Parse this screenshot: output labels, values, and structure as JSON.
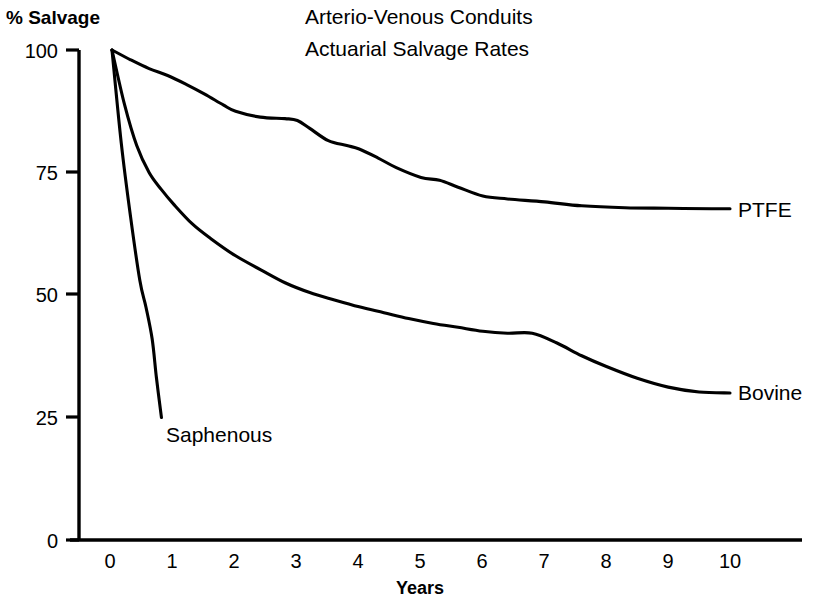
{
  "chart_data": {
    "type": "line",
    "title": "Arterio-Venous Conduits",
    "subtitle": "Actuarial Salvage Rates",
    "xlabel": "Years",
    "ylabel": "% Salvage",
    "xlim": [
      0,
      10
    ],
    "ylim": [
      0,
      100
    ],
    "grid": false,
    "legend_position": "inline-right-end-of-curve",
    "x_ticks": [
      "0",
      "1",
      "2",
      "3",
      "4",
      "5",
      "6",
      "7",
      "8",
      "9",
      "10"
    ],
    "y_ticks": [
      "0",
      "25",
      "50",
      "75",
      "100"
    ],
    "series": [
      {
        "name": "PTFE",
        "label": "PTFE",
        "x": [
          0,
          0.3,
          0.6,
          0.9,
          1.2,
          1.5,
          1.8,
          2.0,
          2.4,
          2.8,
          3.0,
          3.2,
          3.5,
          3.8,
          4.0,
          4.3,
          4.6,
          5.0,
          5.3,
          5.6,
          6.0,
          6.4,
          7.0,
          7.6,
          8.3,
          9.0,
          9.7,
          10.0
        ],
        "values": [
          100,
          98.0,
          96.2,
          94.8,
          93.0,
          91.0,
          88.8,
          87.5,
          86.3,
          86.0,
          85.6,
          84.0,
          81.5,
          80.5,
          79.8,
          78.0,
          76.0,
          74.0,
          73.4,
          72.0,
          70.2,
          69.6,
          69.0,
          68.2,
          67.8,
          67.7,
          67.6,
          67.6
        ]
      },
      {
        "name": "Bovine",
        "label": "Bovine",
        "x": [
          0,
          0.2,
          0.4,
          0.6,
          0.8,
          1.0,
          1.3,
          1.6,
          2.0,
          2.4,
          2.8,
          3.2,
          3.6,
          4.0,
          4.4,
          4.8,
          5.2,
          5.6,
          6.0,
          6.4,
          6.8,
          7.2,
          7.6,
          8.0,
          8.5,
          9.0,
          9.5,
          10.0
        ],
        "values": [
          100,
          89.0,
          80.5,
          75.0,
          71.5,
          68.5,
          64.5,
          61.5,
          58.0,
          55.2,
          52.5,
          50.5,
          49.0,
          47.6,
          46.4,
          45.2,
          44.2,
          43.4,
          42.6,
          42.2,
          42.2,
          40.2,
          37.6,
          35.4,
          33.0,
          31.2,
          30.2,
          30.0
        ]
      },
      {
        "name": "Saphenous",
        "label": "Saphenous",
        "x": [
          0,
          0.15,
          0.3,
          0.45,
          0.55,
          0.65,
          0.72,
          0.8
        ],
        "values": [
          100,
          81.0,
          66.0,
          53.0,
          47.5,
          41.0,
          33.0,
          25.0
        ]
      }
    ],
    "annotations": [
      {
        "text": "PTFE",
        "x": 10.4,
        "y": 67.6
      },
      {
        "text": "Bovine",
        "x": 10.4,
        "y": 30.0
      },
      {
        "text": "Saphenous",
        "x": 0.9,
        "y": 21.0
      }
    ]
  }
}
